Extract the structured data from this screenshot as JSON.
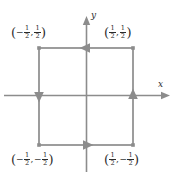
{
  "figure": {
    "type": "diagram",
    "background_color": "#ffffff",
    "stroke_color": "#8c8c8c",
    "text_color": "#2b2b2b"
  },
  "axes": {
    "x_label": "x",
    "y_label": "y",
    "origin": {
      "x": 86.5,
      "y": 95.5
    },
    "x_axis": {
      "start_x": 4,
      "end_x": 170,
      "y": 95.5
    },
    "y_axis": {
      "x": 86.5,
      "start_y": 172,
      "end_y": 16
    }
  },
  "square": {
    "left": 39,
    "right": 133,
    "top": 48,
    "bottom": 145,
    "corners": [
      {
        "name": "top-left",
        "x": -0.5,
        "y": 0.5
      },
      {
        "name": "top-right",
        "x": 0.5,
        "y": 0.5
      },
      {
        "name": "bottom-left",
        "x": -0.5,
        "y": -0.5
      },
      {
        "name": "bottom-right",
        "x": 0.5,
        "y": -0.5
      }
    ]
  },
  "labels": {
    "top_left": {
      "x_num": "1",
      "x_den": "2",
      "x_sign": "−",
      "y_num": "1",
      "y_den": "2",
      "y_sign": ""
    },
    "top_right": {
      "x_num": "1",
      "x_den": "2",
      "x_sign": "",
      "y_num": "1",
      "y_den": "2",
      "y_sign": ""
    },
    "bottom_left": {
      "x_num": "1",
      "x_den": "2",
      "x_sign": "−",
      "y_num": "1",
      "y_den": "2",
      "y_sign": "−"
    },
    "bottom_right": {
      "x_num": "1",
      "x_den": "2",
      "x_sign": "",
      "y_num": "1",
      "y_den": "2",
      "y_sign": "−"
    },
    "open_paren": "(",
    "close_paren": ")",
    "comma": ","
  },
  "arrows": [
    {
      "edge": "top",
      "direction": "left",
      "at_x": 86.5,
      "at_y": 48
    },
    {
      "edge": "left",
      "direction": "down",
      "at_x": 39,
      "at_y": 95.5
    },
    {
      "edge": "bottom",
      "direction": "right",
      "at_x": 86.5,
      "at_y": 145
    },
    {
      "edge": "right",
      "direction": "up",
      "at_x": 133,
      "at_y": 95.5
    }
  ]
}
